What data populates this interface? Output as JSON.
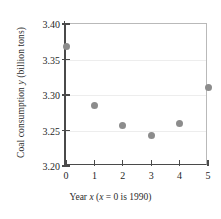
{
  "chart_data": {
    "type": "scatter",
    "title": "",
    "xlabel": "Year x  (x = 0 is 1990)",
    "ylabel": "Coal consumption y (billion tons)",
    "x": [
      0,
      1,
      2,
      3,
      4,
      5
    ],
    "values": [
      3.368,
      3.285,
      3.257,
      3.243,
      3.26,
      3.31
    ],
    "categories": [
      "0",
      "1",
      "2",
      "3",
      "4",
      "5"
    ],
    "xlim": [
      0,
      5
    ],
    "ylim": [
      3.2,
      3.4
    ],
    "xticks": [
      "0",
      "1",
      "2",
      "3",
      "4",
      "5"
    ],
    "yticks": [
      "3.20",
      "3.25",
      "3.30",
      "3.35",
      "3.40"
    ],
    "ytick_values": [
      3.2,
      3.25,
      3.3,
      3.35,
      3.4
    ],
    "grid": "horizontal",
    "legend": "none",
    "marker_color": "#8c8c8c",
    "axis_color": "#4a4a4a",
    "grid_color": "#ededed"
  },
  "axes": {
    "y_title_prefix": "Coal consumption ",
    "y_title_var": "y",
    "y_title_suffix": " (billion tons)",
    "x_title_prefix": "Year ",
    "x_title_var": "x",
    "x_title_mid": "  (",
    "x_title_var2": "x",
    "x_title_suffix": " = 0 is 1990)"
  }
}
